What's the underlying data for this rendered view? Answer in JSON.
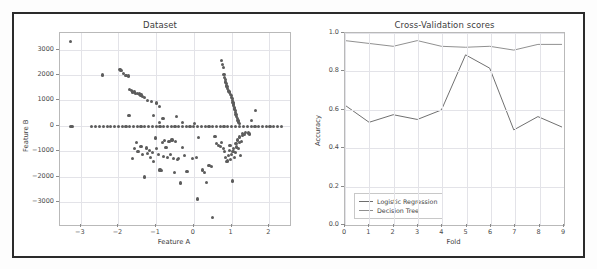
{
  "figure": {
    "background": "#ffffff",
    "frame_color": "#2b2b2b"
  },
  "chart_data": [
    {
      "id": "dataset-scatter",
      "type": "scatter",
      "title": "Dataset",
      "xlabel": "Feature A",
      "ylabel": "Feature B",
      "xlim": [
        -3.55,
        2.55
      ],
      "ylim": [
        -3900,
        3650
      ],
      "xticks": [
        -3,
        -2,
        -1,
        0,
        1,
        2
      ],
      "yticks": [
        3000,
        2000,
        1000,
        0,
        -1000,
        -2000,
        -3000
      ],
      "grid": true,
      "legend": null,
      "marker_color": "#5c5c5c",
      "points": [
        [
          -3.28,
          3300
        ],
        [
          -2.42,
          2000
        ],
        [
          -1.96,
          2230
        ],
        [
          -1.93,
          2180
        ],
        [
          -1.86,
          2060
        ],
        [
          -1.8,
          1990
        ],
        [
          -1.74,
          1960
        ],
        [
          -1.7,
          1440
        ],
        [
          -1.66,
          1400
        ],
        [
          -1.63,
          1330
        ],
        [
          -1.58,
          1330
        ],
        [
          -1.54,
          1270
        ],
        [
          -1.5,
          1270
        ],
        [
          -1.44,
          1250
        ],
        [
          -1.4,
          1210
        ],
        [
          -1.36,
          1140
        ],
        [
          -1.3,
          1110
        ],
        [
          -1.22,
          980
        ],
        [
          -1.12,
          960
        ],
        [
          -1.0,
          900
        ],
        [
          -0.92,
          760
        ],
        [
          -1.72,
          390
        ],
        [
          -1.06,
          420
        ],
        [
          -0.82,
          300
        ],
        [
          -0.46,
          380
        ],
        [
          -0.92,
          140
        ],
        [
          -0.3,
          120
        ],
        [
          0.02,
          100
        ],
        [
          0.74,
          2560
        ],
        [
          0.76,
          2420
        ],
        [
          0.78,
          2300
        ],
        [
          0.8,
          2010
        ],
        [
          0.81,
          1900
        ],
        [
          0.83,
          1830
        ],
        [
          0.84,
          1720
        ],
        [
          0.86,
          1680
        ],
        [
          0.87,
          1600
        ],
        [
          0.88,
          1540
        ],
        [
          0.9,
          1480
        ],
        [
          0.91,
          1390
        ],
        [
          0.93,
          1340
        ],
        [
          0.95,
          1300
        ],
        [
          0.97,
          1240
        ],
        [
          0.99,
          1190
        ],
        [
          1.0,
          1120
        ],
        [
          1.02,
          1060
        ],
        [
          1.03,
          1000
        ],
        [
          1.04,
          930
        ],
        [
          1.05,
          860
        ],
        [
          1.06,
          800
        ],
        [
          1.07,
          730
        ],
        [
          1.08,
          660
        ],
        [
          1.1,
          590
        ],
        [
          1.11,
          520
        ],
        [
          1.12,
          450
        ],
        [
          1.14,
          380
        ],
        [
          1.15,
          300
        ],
        [
          1.17,
          220
        ],
        [
          1.18,
          150
        ],
        [
          1.2,
          90
        ],
        [
          1.64,
          590
        ],
        [
          1.52,
          220
        ],
        [
          -3.26,
          -30
        ],
        [
          -3.22,
          -20
        ],
        [
          -2.72,
          -25
        ],
        [
          -2.6,
          -15
        ],
        [
          -2.5,
          -20
        ],
        [
          -2.4,
          -20
        ],
        [
          -2.3,
          -15
        ],
        [
          -2.2,
          -25
        ],
        [
          -2.1,
          -15
        ],
        [
          -2.0,
          -20
        ],
        [
          -1.9,
          -15
        ],
        [
          -1.8,
          -20
        ],
        [
          -1.7,
          -15
        ],
        [
          -1.6,
          -20
        ],
        [
          -1.5,
          -15
        ],
        [
          -1.4,
          -20
        ],
        [
          -1.3,
          -15
        ],
        [
          -1.2,
          -20
        ],
        [
          -1.1,
          -15
        ],
        [
          -1.0,
          -20
        ],
        [
          -0.9,
          -15
        ],
        [
          -0.8,
          -20
        ],
        [
          -0.7,
          -15
        ],
        [
          -0.6,
          -20
        ],
        [
          -0.5,
          -15
        ],
        [
          -0.4,
          -20
        ],
        [
          -0.3,
          -15
        ],
        [
          -0.2,
          -20
        ],
        [
          -0.1,
          -15
        ],
        [
          0.0,
          -20
        ],
        [
          0.1,
          -15
        ],
        [
          0.2,
          -20
        ],
        [
          0.3,
          -15
        ],
        [
          0.4,
          -20
        ],
        [
          0.5,
          -15
        ],
        [
          0.6,
          -20
        ],
        [
          0.7,
          -15
        ],
        [
          0.8,
          -20
        ],
        [
          0.9,
          -15
        ],
        [
          1.0,
          -20
        ],
        [
          1.1,
          -15
        ],
        [
          1.22,
          -20
        ],
        [
          1.32,
          -15
        ],
        [
          1.42,
          -20
        ],
        [
          1.52,
          -15
        ],
        [
          1.62,
          -20
        ],
        [
          1.72,
          -15
        ],
        [
          1.82,
          -20
        ],
        [
          1.92,
          -15
        ],
        [
          2.02,
          -20
        ],
        [
          2.12,
          -15
        ],
        [
          2.22,
          -20
        ],
        [
          2.32,
          -15
        ],
        [
          -1.62,
          -1290
        ],
        [
          -1.52,
          -640
        ],
        [
          -1.58,
          -900
        ],
        [
          -1.48,
          -1020
        ],
        [
          -1.4,
          -800
        ],
        [
          -1.36,
          -1120
        ],
        [
          -1.3,
          -2010
        ],
        [
          -1.26,
          -870
        ],
        [
          -1.22,
          -1080
        ],
        [
          -1.18,
          -960
        ],
        [
          -1.14,
          -1240
        ],
        [
          -1.1,
          -1050
        ],
        [
          -1.06,
          -1400
        ],
        [
          -1.02,
          -480
        ],
        [
          -0.98,
          -900
        ],
        [
          -0.94,
          -1140
        ],
        [
          -0.9,
          -1740
        ],
        [
          -0.86,
          -1760
        ],
        [
          -0.84,
          -640
        ],
        [
          -0.8,
          -1210
        ],
        [
          -0.78,
          -580
        ],
        [
          -0.74,
          -860
        ],
        [
          -0.7,
          -1260
        ],
        [
          -0.66,
          -620
        ],
        [
          -0.62,
          -1120
        ],
        [
          -0.58,
          -560
        ],
        [
          -0.54,
          -1300
        ],
        [
          -0.52,
          -1850
        ],
        [
          -0.48,
          -620
        ],
        [
          -0.44,
          -1320
        ],
        [
          -0.4,
          -1280
        ],
        [
          -0.36,
          -2250
        ],
        [
          -0.3,
          -840
        ],
        [
          -0.24,
          -1180
        ],
        [
          -0.2,
          -1800
        ],
        [
          -0.16,
          -1790
        ],
        [
          -0.04,
          -1300
        ],
        [
          0.06,
          -1240
        ],
        [
          0.1,
          -2880
        ],
        [
          0.12,
          -450
        ],
        [
          0.24,
          -1740
        ],
        [
          0.28,
          -1820
        ],
        [
          0.34,
          -2220
        ],
        [
          0.4,
          -1560
        ],
        [
          0.46,
          -1600
        ],
        [
          0.5,
          -3590
        ],
        [
          0.6,
          -700
        ],
        [
          0.66,
          -760
        ],
        [
          0.7,
          -820
        ],
        [
          0.74,
          -660
        ],
        [
          0.78,
          -900
        ],
        [
          0.82,
          -1020
        ],
        [
          0.84,
          -1260
        ],
        [
          0.86,
          -1410
        ],
        [
          0.9,
          -1380
        ],
        [
          0.92,
          -1180
        ],
        [
          0.94,
          -980
        ],
        [
          0.96,
          -760
        ],
        [
          0.98,
          -1320
        ],
        [
          1.0,
          -1130
        ],
        [
          1.02,
          -2170
        ],
        [
          1.04,
          -1000
        ],
        [
          1.06,
          -880
        ],
        [
          1.08,
          -1250
        ],
        [
          1.1,
          -1060
        ],
        [
          1.12,
          -700
        ],
        [
          1.14,
          -830
        ],
        [
          1.16,
          -560
        ],
        [
          1.18,
          -900
        ],
        [
          1.2,
          -640
        ],
        [
          1.22,
          -440
        ],
        [
          1.24,
          -1180
        ],
        [
          1.26,
          -620
        ],
        [
          1.28,
          -380
        ],
        [
          1.3,
          -300
        ],
        [
          1.34,
          -340
        ],
        [
          1.38,
          -260
        ],
        [
          1.44,
          -280
        ],
        [
          1.48,
          -320
        ],
        [
          0.56,
          -430
        ]
      ]
    },
    {
      "id": "cross-validation-scores",
      "type": "line",
      "title": "Cross-Validation scores",
      "xlabel": "Fold",
      "ylabel": "Accuracy",
      "xlim": [
        0,
        9
      ],
      "ylim": [
        0.0,
        1.0
      ],
      "xticks": [
        0,
        1,
        2,
        3,
        4,
        5,
        6,
        7,
        8,
        9
      ],
      "yticks": [
        "0.0",
        "0.2",
        "0.4",
        "0.6",
        "0.8",
        "1.0"
      ],
      "grid": true,
      "legend_position": "lower left",
      "x": [
        0,
        1,
        2,
        3,
        4,
        5,
        6,
        7,
        8,
        9
      ],
      "series": [
        {
          "name": "Logistic Regression",
          "color": "#6e6e6e",
          "values": [
            0.62,
            0.53,
            0.57,
            0.545,
            0.595,
            0.885,
            0.815,
            0.49,
            0.56,
            0.505
          ]
        },
        {
          "name": "Decision Tree",
          "color": "#8f8f8f",
          "values": [
            0.96,
            0.945,
            0.93,
            0.96,
            0.93,
            0.925,
            0.93,
            0.91,
            0.94,
            0.94
          ]
        }
      ]
    }
  ]
}
